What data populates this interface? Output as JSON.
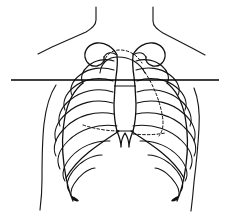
{
  "figure": {
    "view": "anterior",
    "canvas": {
      "width": 229,
      "height": 224,
      "background": "#ffffff"
    },
    "line_color": "#111111",
    "accent_color": "#000000"
  },
  "annotations": {
    "reference_line": {
      "name": "horizontal level line",
      "x_start": 11,
      "x_end": 219,
      "y": 80,
      "color": "#000000",
      "style": "solid",
      "thickness_px": 1.7
    },
    "dashed_markings": {
      "style": "dashed",
      "count": 3,
      "description": "dashed aortic arch contour beneath the clavicular notch and dashed lung border lines inside the rib cage"
    }
  },
  "structures": [
    {
      "id": "neck-left",
      "label": "Left neck border",
      "type": "body-outline",
      "dashed": false
    },
    {
      "id": "neck-right",
      "label": "Right neck border",
      "type": "body-outline",
      "dashed": false
    },
    {
      "id": "shoulder-left",
      "label": "Left shoulder slope",
      "type": "body-outline",
      "dashed": false
    },
    {
      "id": "shoulder-right",
      "label": "Right shoulder slope",
      "type": "body-outline",
      "dashed": false
    },
    {
      "id": "flank-left",
      "label": "Left lateral trunk wall",
      "type": "body-outline",
      "dashed": false
    },
    {
      "id": "flank-right",
      "label": "Right lateral trunk wall",
      "type": "body-outline",
      "dashed": false
    },
    {
      "id": "clavicle-left",
      "label": "Left clavicle",
      "type": "bone",
      "dashed": false
    },
    {
      "id": "clavicle-right",
      "label": "Right clavicle",
      "type": "bone",
      "dashed": false
    },
    {
      "id": "manubrium",
      "label": "Manubrium",
      "type": "bone",
      "dashed": false
    },
    {
      "id": "sternum-body",
      "label": "Body of sternum",
      "type": "bone",
      "dashed": false
    },
    {
      "id": "xiphoid",
      "label": "Xiphoid process",
      "type": "bone",
      "dashed": false
    },
    {
      "id": "ribs-left",
      "label": "Left ribs 1-10",
      "type": "bone",
      "dashed": false
    },
    {
      "id": "ribs-right",
      "label": "Right ribs 1-10",
      "type": "bone",
      "dashed": false
    },
    {
      "id": "costal-margin-left",
      "label": "Left costal margin",
      "type": "bone",
      "dashed": false
    },
    {
      "id": "costal-margin-right",
      "label": "Right costal margin",
      "type": "bone",
      "dashed": false
    },
    {
      "id": "aortic-arch",
      "label": "Aortic arch contour",
      "type": "soft-tissue",
      "dashed": true
    },
    {
      "id": "lung-border-left",
      "label": "Left lung border",
      "type": "soft-tissue",
      "dashed": true
    },
    {
      "id": "lung-border-right",
      "label": "Right lung border",
      "type": "soft-tissue",
      "dashed": true
    }
  ],
  "rib_counts": {
    "left": 10,
    "right": 10
  },
  "caption": ""
}
